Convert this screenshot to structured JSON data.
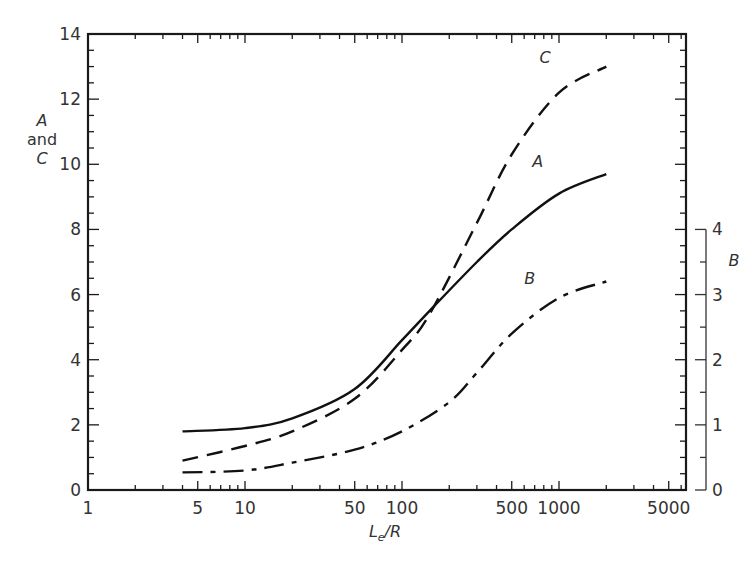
{
  "chart_data": {
    "type": "line",
    "title": "",
    "xlabel": "L_e/R",
    "xlabel_main": "L",
    "xlabel_sub": "e",
    "xlabel_tail": "/R",
    "x_scale": "log",
    "xlim": [
      1,
      6300
    ],
    "x_ticks_labeled": [
      1,
      5,
      10,
      50,
      100,
      500,
      1000,
      5000
    ],
    "x_tick_labels": [
      "1",
      "5",
      "10",
      "50",
      "100",
      "500",
      "1000",
      "5000"
    ],
    "ylabel_left": [
      "A",
      "and",
      "C"
    ],
    "ylim_left": [
      0,
      14
    ],
    "y_ticks_left": [
      0,
      2,
      4,
      6,
      8,
      10,
      12,
      14
    ],
    "y_tick_labels_left": [
      "0",
      "2",
      "4",
      "6",
      "8",
      "10",
      "12",
      "14"
    ],
    "ylabel_right": "B",
    "ylim_right": [
      0,
      4
    ],
    "y_ticks_right": [
      0,
      1,
      2,
      3,
      4
    ],
    "y_tick_labels_right": [
      "0",
      "1",
      "2",
      "3",
      "4"
    ],
    "grid": false,
    "legend": "inline curve labels",
    "series": [
      {
        "name": "A",
        "axis": "left",
        "style": "solid",
        "x": [
          4,
          10,
          20,
          50,
          100,
          150,
          300,
          500,
          1000,
          2000
        ],
        "values": [
          1.8,
          1.9,
          2.2,
          3.1,
          4.6,
          5.5,
          7.0,
          8.0,
          9.1,
          9.7
        ]
      },
      {
        "name": "C",
        "axis": "left",
        "style": "dashed",
        "x": [
          4,
          10,
          20,
          50,
          100,
          150,
          300,
          500,
          1000,
          2000
        ],
        "values": [
          0.9,
          1.35,
          1.8,
          2.8,
          4.3,
          5.4,
          8.2,
          10.3,
          12.2,
          13.0
        ]
      },
      {
        "name": "B",
        "axis": "right",
        "style": "dash-dot",
        "x": [
          4,
          10,
          20,
          50,
          100,
          200,
          300,
          500,
          1000,
          2000
        ],
        "values": [
          0.27,
          0.3,
          0.42,
          0.62,
          0.9,
          1.35,
          1.8,
          2.4,
          2.95,
          3.2
        ]
      }
    ],
    "annotations": [
      {
        "text": "C",
        "x": 1000,
        "y": 13.3
      },
      {
        "text": "A",
        "x": 900,
        "y": 10.1
      },
      {
        "text": "B",
        "x": 800,
        "y": 6.5
      }
    ]
  }
}
